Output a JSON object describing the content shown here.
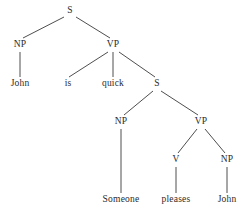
{
  "figure": {
    "kind": "syntax-parse-tree",
    "background_color": "#ffffff",
    "line_color": "#3a3a3a",
    "text_color": "#2b2b2b",
    "width": 246,
    "height": 217
  },
  "nodes": [
    {
      "id": "s-root",
      "label": "S",
      "type": "nonterminal",
      "x": 70,
      "y": 11
    },
    {
      "id": "np-subject",
      "label": "NP",
      "type": "nonterminal",
      "x": 20,
      "y": 45
    },
    {
      "id": "vp-main",
      "label": "VP",
      "type": "nonterminal",
      "x": 113,
      "y": 45
    },
    {
      "id": "word-john-1",
      "label": "John",
      "type": "terminal",
      "x": 20,
      "y": 84
    },
    {
      "id": "word-is",
      "label": "is",
      "type": "terminal",
      "x": 68,
      "y": 84
    },
    {
      "id": "word-quick",
      "label": "quick",
      "type": "terminal",
      "x": 113,
      "y": 84
    },
    {
      "id": "s-embedded",
      "label": "S",
      "type": "nonterminal",
      "x": 157,
      "y": 84
    },
    {
      "id": "np-embedded",
      "label": "NP",
      "type": "nonterminal",
      "x": 121,
      "y": 122
    },
    {
      "id": "vp-embedded",
      "label": "VP",
      "type": "nonterminal",
      "x": 201,
      "y": 122
    },
    {
      "id": "v-embedded",
      "label": "V",
      "type": "nonterminal",
      "x": 176,
      "y": 160
    },
    {
      "id": "np-object",
      "label": "NP",
      "type": "nonterminal",
      "x": 227,
      "y": 160
    },
    {
      "id": "word-someone",
      "label": "Someone",
      "type": "terminal",
      "x": 121,
      "y": 200
    },
    {
      "id": "word-pleases",
      "label": "pleases",
      "type": "terminal",
      "x": 176,
      "y": 200
    },
    {
      "id": "word-john-2",
      "label": "John",
      "type": "terminal",
      "x": 227,
      "y": 200
    }
  ],
  "edges": [
    {
      "id": "edge-s-np",
      "from": "s-root",
      "to": "np-subject",
      "x1": 64,
      "y1": 17,
      "x2": 23,
      "y2": 38
    },
    {
      "id": "edge-s-vp",
      "from": "s-root",
      "to": "vp-main",
      "x1": 76,
      "y1": 17,
      "x2": 110,
      "y2": 38
    },
    {
      "id": "edge-np-john",
      "from": "np-subject",
      "to": "word-john-1",
      "x1": 20,
      "y1": 52,
      "x2": 20,
      "y2": 77
    },
    {
      "id": "edge-vp-is",
      "from": "vp-main",
      "to": "word-is",
      "x1": 108,
      "y1": 52,
      "x2": 69,
      "y2": 77
    },
    {
      "id": "edge-vp-quick",
      "from": "vp-main",
      "to": "word-quick",
      "x1": 113,
      "y1": 52,
      "x2": 113,
      "y2": 77
    },
    {
      "id": "edge-vp-s",
      "from": "vp-main",
      "to": "s-embedded",
      "x1": 119,
      "y1": 52,
      "x2": 155,
      "y2": 77
    },
    {
      "id": "edge-s2-np",
      "from": "s-embedded",
      "to": "np-embedded",
      "x1": 153,
      "y1": 91,
      "x2": 124,
      "y2": 115
    },
    {
      "id": "edge-s2-vp",
      "from": "s-embedded",
      "to": "vp-embedded",
      "x1": 161,
      "y1": 91,
      "x2": 198,
      "y2": 115
    },
    {
      "id": "edge-np2-someone",
      "from": "np-embedded",
      "to": "word-someone",
      "x1": 121,
      "y1": 129,
      "x2": 121,
      "y2": 193
    },
    {
      "id": "edge-vp2-v",
      "from": "vp-embedded",
      "to": "v-embedded",
      "x1": 197,
      "y1": 129,
      "x2": 178,
      "y2": 153
    },
    {
      "id": "edge-vp2-np",
      "from": "vp-embedded",
      "to": "np-object",
      "x1": 205,
      "y1": 129,
      "x2": 225,
      "y2": 153
    },
    {
      "id": "edge-v-pleases",
      "from": "v-embedded",
      "to": "word-pleases",
      "x1": 176,
      "y1": 167,
      "x2": 176,
      "y2": 193
    },
    {
      "id": "edge-np3-john",
      "from": "np-object",
      "to": "word-john-2",
      "x1": 227,
      "y1": 167,
      "x2": 227,
      "y2": 193
    }
  ]
}
